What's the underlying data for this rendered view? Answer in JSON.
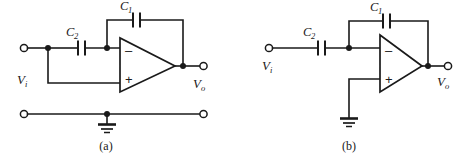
{
  "figure": {
    "background_color": "#ffffff",
    "line_color": "#1a1a1a",
    "panels": [
      {
        "id": "a",
        "caption": "(a)",
        "input_label": "V",
        "input_sub": "i",
        "output_label": "V",
        "output_sub": "o",
        "feedback_cap_label": "C",
        "feedback_cap_sub": "1",
        "series_cap_label": "C",
        "series_cap_sub": "2",
        "inverting_sign": "–",
        "noninverting_sign": "+",
        "ground_present": "true",
        "ground_rail": "true"
      },
      {
        "id": "b",
        "caption": "(b)",
        "input_label": "V",
        "input_sub": "i",
        "output_label": "V",
        "output_sub": "o",
        "feedback_cap_label": "C",
        "feedback_cap_sub": "1",
        "series_cap_label": "C",
        "series_cap_sub": "2",
        "inverting_sign": "–",
        "noninverting_sign": "+",
        "ground_present": "true",
        "ground_rail": "false"
      }
    ]
  }
}
